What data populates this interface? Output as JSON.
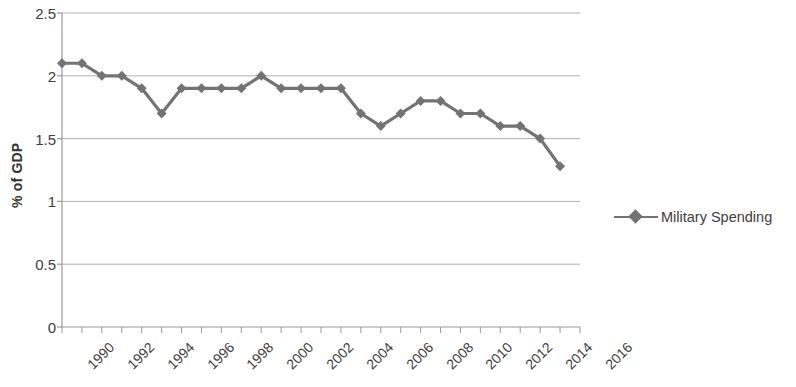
{
  "chart_data": {
    "type": "line",
    "title": "",
    "xlabel": "",
    "ylabel": "% of GDP",
    "ylim": [
      0,
      2.5
    ],
    "ytick_values": [
      0,
      0.5,
      1,
      1.5,
      2,
      2.5
    ],
    "ytick_labels": [
      "0",
      "0.5",
      "1",
      "1.5",
      "2",
      "2.5"
    ],
    "xlim": [
      1990,
      2016
    ],
    "xtick_labels": [
      "1990",
      "1992",
      "1994",
      "1996",
      "1998",
      "2000",
      "2002",
      "2004",
      "2006",
      "2008",
      "2010",
      "2012",
      "2014",
      "2016"
    ],
    "xtick_values": [
      1990,
      1992,
      1994,
      1996,
      1998,
      2000,
      2002,
      2004,
      2006,
      2008,
      2010,
      2012,
      2014,
      2016
    ],
    "x_minor_ticks_every": 1,
    "grid": "horizontal",
    "legend_position": "right",
    "series": [
      {
        "name": "Military Spending",
        "color": "#737373",
        "marker": "diamond",
        "x": [
          1990,
          1991,
          1992,
          1993,
          1994,
          1995,
          1996,
          1997,
          1998,
          1999,
          2000,
          2001,
          2002,
          2003,
          2004,
          2005,
          2006,
          2007,
          2008,
          2009,
          2010,
          2011,
          2012,
          2013,
          2014,
          2015
        ],
        "values": [
          2.1,
          2.1,
          2.0,
          2.0,
          1.9,
          1.7,
          1.9,
          1.9,
          1.9,
          1.9,
          2.0,
          1.9,
          1.9,
          1.9,
          1.9,
          1.7,
          1.6,
          1.7,
          1.8,
          1.8,
          1.7,
          1.7,
          1.6,
          1.6,
          1.5,
          1.28
        ]
      }
    ]
  },
  "legend": {
    "entries": [
      {
        "label": "Military Spending",
        "color": "#737373"
      }
    ]
  },
  "axis_colors": {
    "grid": "#b0b0b0",
    "axis": "#9a9a9a",
    "text": "#3d3d3d"
  }
}
